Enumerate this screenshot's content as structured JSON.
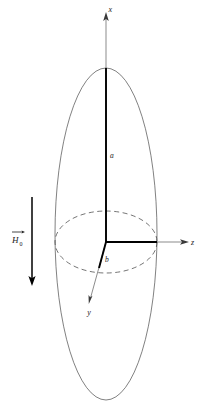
{
  "figure": {
    "background_color": "#ffffff",
    "line_color": "#3a3a3a",
    "bold_line_color": "#000000",
    "text_color": "#1a1a1a"
  },
  "labels": {
    "axis_x": "x",
    "axis_y": "y",
    "axis_z": "z",
    "semi_axis_major": "a",
    "semi_axis_minor": "b",
    "field_vector": "H",
    "field_subscript": "0"
  },
  "geometry": {
    "center": {
      "x": 106,
      "y": 242
    },
    "spheroid_outline": {
      "shape": "ellipse",
      "semi_axis_vertical_px": 166,
      "semi_axis_horizontal_px": 51,
      "stroke": "solid"
    },
    "equatorial_circle": {
      "shape": "ellipse",
      "semi_axis_horizontal_px": 51,
      "semi_axis_vertical_px": 31,
      "stroke": "dashed"
    },
    "axis_x_tip": {
      "x": 106,
      "y": 13
    },
    "axis_z_tip": {
      "x": 188,
      "y": 242
    },
    "axis_y_tip": {
      "x": 89,
      "y": 303
    },
    "semi_axis_a_end": {
      "x": 106,
      "y": 68
    },
    "semi_axis_b_end": {
      "x": 157,
      "y": 242
    },
    "field_arrow": {
      "x": 32,
      "y_start": 197,
      "y_end": 285,
      "direction": "down"
    }
  }
}
